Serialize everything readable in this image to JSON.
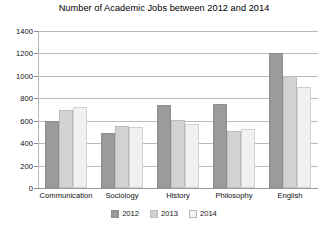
{
  "chart_data": {
    "type": "bar",
    "title": "Number of Academic Jobs between 2012 and 2014",
    "xlabel": "",
    "ylabel": "",
    "ylim": [
      0,
      1400
    ],
    "ytick_step": 200,
    "yticks": [
      "0",
      "200",
      "400",
      "600",
      "800",
      "1000",
      "1200",
      "1400"
    ],
    "grid": true,
    "legend_position": "bottom",
    "categories": [
      "Communication",
      "Sociology",
      "History",
      "Philosophy",
      "English"
    ],
    "series": [
      {
        "name": "2012",
        "color": "#9b9b9b",
        "values": [
          600,
          490,
          740,
          750,
          1200
        ]
      },
      {
        "name": "2013",
        "color": "#d2d2d2",
        "values": [
          700,
          550,
          610,
          510,
          1000
        ]
      },
      {
        "name": "2014",
        "color": "#f1f1f1",
        "values": [
          720,
          540,
          570,
          530,
          900
        ]
      }
    ]
  },
  "legend": {
    "items": [
      {
        "label": "2012"
      },
      {
        "label": "2013"
      },
      {
        "label": "2014"
      }
    ]
  }
}
